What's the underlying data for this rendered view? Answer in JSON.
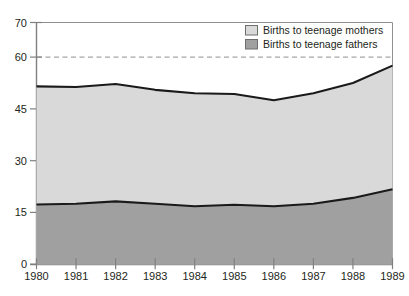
{
  "chart_data": {
    "type": "area",
    "stacked": true,
    "title": "",
    "subtitle": "",
    "xlabel": "",
    "ylabel": "",
    "categories": [
      "1980",
      "1981",
      "1982",
      "1983",
      "1984",
      "1985",
      "1986",
      "1987",
      "1988",
      "1989"
    ],
    "x": [
      1980,
      1981,
      1982,
      1983,
      1984,
      1985,
      1986,
      1987,
      1988,
      1989
    ],
    "series": [
      {
        "name": "Births to teenage mothers",
        "color": "#d9d9d9",
        "values": [
          51.5,
          51.3,
          52.2,
          50.5,
          49.5,
          49.3,
          47.5,
          49.5,
          52.5,
          57.5
        ]
      },
      {
        "name": "Births to teenage fathers",
        "color": "#a0a0a0",
        "values": [
          17.3,
          17.5,
          18.2,
          17.5,
          16.8,
          17.2,
          16.8,
          17.5,
          19.2,
          21.7
        ]
      }
    ],
    "ylim": [
      0,
      70
    ],
    "xlim": [
      1980,
      1989
    ],
    "yticks": [
      0,
      15,
      30,
      45,
      60,
      70
    ],
    "ytick_labels": [
      "0",
      "15",
      "30",
      "45",
      "60",
      "70"
    ],
    "xtick_labels": [
      "1980",
      "1981",
      "1982",
      "1983",
      "1984",
      "1985",
      "1986",
      "1987",
      "1988",
      "1989"
    ],
    "gridlines": [
      15,
      30,
      45,
      60
    ],
    "grid": true,
    "grid_style": "dashed",
    "legend_position": "top-right"
  },
  "legend": {
    "items": [
      {
        "label": "Births to teenage mothers",
        "swatch": "#d9d9d9"
      },
      {
        "label": "Births to teenage fathers",
        "swatch": "#a0a0a0"
      }
    ]
  },
  "colors": {
    "mothers_fill": "#d9d9d9",
    "fathers_fill": "#a0a0a0",
    "line": "#1a1a1a",
    "axis": "#808080",
    "grid": "#9a9a9a",
    "text": "#231f20",
    "background": "#ffffff"
  }
}
